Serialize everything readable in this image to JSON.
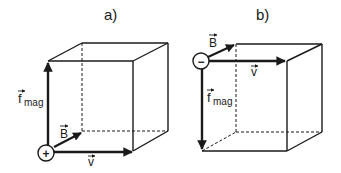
{
  "panels": [
    {
      "label": "a)",
      "charge_sign": "+",
      "vectors": {
        "f_mag": {
          "symbol": "f",
          "subscript": "mag",
          "direction": "up"
        },
        "B": {
          "symbol": "B",
          "direction": "into page (diagonal)"
        },
        "v": {
          "symbol": "v",
          "direction": "right"
        }
      }
    },
    {
      "label": "b)",
      "charge_sign": "−",
      "vectors": {
        "f_mag": {
          "symbol": "f",
          "subscript": "mag",
          "direction": "down"
        },
        "B": {
          "symbol": "B",
          "direction": "into page (diagonal)"
        },
        "v": {
          "symbol": "v",
          "direction": "right"
        }
      }
    }
  ],
  "colors": {
    "line": "#1a1a1a",
    "background": "#ffffff"
  }
}
